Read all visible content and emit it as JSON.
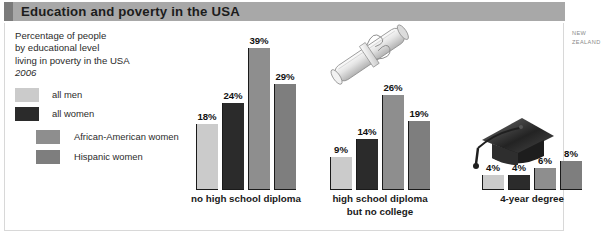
{
  "title": "Education and poverty in the USA",
  "caption": {
    "line1": "Percentage of people",
    "line2": "by educational level",
    "line3": "living in poverty in the USA",
    "year": "2006"
  },
  "side_note": {
    "line1": "NEW",
    "line2": "ZEALAND"
  },
  "colors": {
    "all_men": "#cbcbcb",
    "all_women": "#2b2b2b",
    "african_american_women": "#8e8e8e",
    "hispanic_women": "#7e7e7e",
    "title_bar": "#a8a8a8",
    "title_accent": "#7b7b7b",
    "frame_border": "#d8d8d8"
  },
  "legend": {
    "items": [
      {
        "label": "all men",
        "color": "#cbcbcb"
      },
      {
        "label": "all women",
        "color": "#2b2b2b"
      },
      {
        "label": "African-American women",
        "color": "#8e8e8e"
      },
      {
        "label": "Hispanic women",
        "color": "#7e7e7e"
      }
    ]
  },
  "illustrations": [
    {
      "name": "rolled-diploma-illustration"
    },
    {
      "name": "graduation-cap-illustration"
    }
  ],
  "chart_data": {
    "type": "bar",
    "title": "Education and poverty in the USA",
    "subtitle": "Percentage of people by educational level living in poverty in the USA, 2006",
    "xlabel": "",
    "ylabel": "Percentage of people living in poverty",
    "ylim": [
      0,
      39
    ],
    "grid": false,
    "legend_position": "upper-left",
    "unit": "%",
    "categories": [
      "no high school diploma",
      "high school diploma but no college",
      "4-year degree"
    ],
    "category_labels": [
      [
        "no high school diploma"
      ],
      [
        "high school diploma",
        "but no college"
      ],
      [
        "4-year degree"
      ]
    ],
    "series": [
      {
        "name": "all men",
        "color": "#cbcbcb",
        "values": [
          18,
          9,
          4
        ],
        "value_labels": [
          "18%",
          "9%",
          "4%"
        ]
      },
      {
        "name": "all women",
        "color": "#2b2b2b",
        "values": [
          24,
          14,
          4
        ],
        "value_labels": [
          "24%",
          "14%",
          "4%"
        ]
      },
      {
        "name": "African-American women",
        "color": "#8e8e8e",
        "values": [
          39,
          26,
          6
        ],
        "value_labels": [
          "39%",
          "26%",
          "6%"
        ]
      },
      {
        "name": "Hispanic women",
        "color": "#7e7e7e",
        "values": [
          29,
          19,
          8
        ],
        "value_labels": [
          "29%",
          "19%",
          "8%"
        ]
      }
    ]
  }
}
